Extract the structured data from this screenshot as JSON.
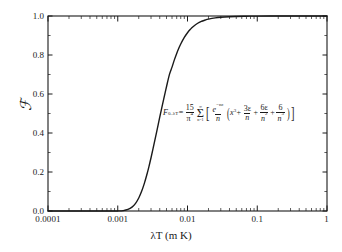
{
  "chart_data": {
    "type": "line",
    "title": "",
    "subtitle": "",
    "xlabel": "λT (m K)",
    "ylabel": "ℱ",
    "xscale": "log",
    "yscale": "linear",
    "xlim": [
      0.0001,
      1
    ],
    "ylim": [
      0.0,
      1.0
    ],
    "grid": false,
    "legend": null,
    "xticks": [
      {
        "value": 0.0001,
        "label": "0.0001"
      },
      {
        "value": 0.001,
        "label": "0.001"
      },
      {
        "value": 0.01,
        "label": "0.01"
      },
      {
        "value": 0.1,
        "label": "0.1"
      },
      {
        "value": 1,
        "label": "1"
      }
    ],
    "yticks": [
      {
        "value": 0.0,
        "label": "0.0"
      },
      {
        "value": 0.2,
        "label": "0.2"
      },
      {
        "value": 0.4,
        "label": "0.4"
      },
      {
        "value": 0.6,
        "label": "0.6"
      },
      {
        "value": 0.8,
        "label": "0.8"
      },
      {
        "value": 1.0,
        "label": "1.0"
      }
    ],
    "series": [
      {
        "name": "F_{0-λT}",
        "color": "#1a1a1a",
        "linewidth": 1.4,
        "x": [
          0.0001,
          0.00015,
          0.0002,
          0.0003,
          0.0004,
          0.0005,
          0.0006,
          0.0007,
          0.0008,
          0.0009,
          0.001,
          0.0012,
          0.0014,
          0.0016,
          0.0018,
          0.002,
          0.0022,
          0.0024,
          0.0026,
          0.0028,
          0.003,
          0.0032,
          0.0034,
          0.0036,
          0.0038,
          0.004,
          0.0042,
          0.0045,
          0.0048,
          0.005,
          0.0055,
          0.006,
          0.0065,
          0.007,
          0.0075,
          0.008,
          0.009,
          0.01,
          0.011,
          0.012,
          0.014,
          0.016,
          0.018,
          0.02,
          0.025,
          0.03,
          0.04,
          0.05,
          0.07,
          0.1,
          0.2,
          0.4,
          0.7,
          1.0
        ],
        "y": [
          0.0,
          0.0,
          0.0,
          0.0,
          0.0,
          0.0,
          0.0,
          0.0,
          0.0,
          0.0001,
          0.0003,
          0.0021,
          0.0079,
          0.0197,
          0.0393,
          0.0667,
          0.1009,
          0.1403,
          0.1831,
          0.2279,
          0.2732,
          0.3181,
          0.3617,
          0.4036,
          0.4434,
          0.4809,
          0.516,
          0.565,
          0.6095,
          0.6372,
          0.6995,
          0.7378,
          0.7763,
          0.8081,
          0.8344,
          0.8562,
          0.89,
          0.9142,
          0.9318,
          0.9451,
          0.9629,
          0.9731,
          0.9797,
          0.9841,
          0.9902,
          0.9934,
          0.9965,
          0.9978,
          0.9989,
          0.9995,
          0.9999,
          1.0,
          1.0,
          1.0
        ]
      }
    ],
    "annotations": [
      {
        "name": "formula",
        "lhs": "F",
        "lhs_sub": "0–λT",
        "equals": "=",
        "prefactor_num": "15",
        "prefactor_den": "π",
        "prefactor_den_exp": "4",
        "sum_upper": "∞",
        "sum_lower": "n=1",
        "term1_num": "e",
        "term1_num_exp": "−nε",
        "term1_den": "n",
        "inner_1": "x",
        "inner_1_exp": "3",
        "inner_2_num": "3ε",
        "inner_2_den": "n",
        "inner_3_num": "6ε",
        "inner_3_den": "n",
        "inner_3_den_exp": "2",
        "inner_4_num": "6",
        "inner_4_den": "n",
        "inner_4_den_exp": "3",
        "plus": "+"
      }
    ]
  },
  "axes": {
    "frame_color": "#1a1a1a",
    "background": "#ffffff"
  }
}
